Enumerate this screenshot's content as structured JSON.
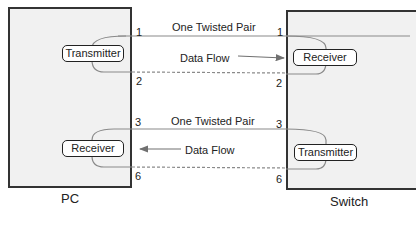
{
  "devices": {
    "pc": {
      "label": "PC",
      "top_component": "Transmitter",
      "bottom_component": "Receiver"
    },
    "switch": {
      "label": "Switch",
      "top_component": "Receiver",
      "bottom_component": "Transmitter"
    }
  },
  "pairs": [
    {
      "label": "One Twisted Pair",
      "flow_label": "Data Flow",
      "direction": "pc-to-switch",
      "pins_left": [
        "1",
        "2"
      ],
      "pins_right": [
        "1",
        "2"
      ]
    },
    {
      "label": "One Twisted Pair",
      "flow_label": "Data Flow",
      "direction": "switch-to-pc",
      "pins_left": [
        "3",
        "6"
      ],
      "pins_right": [
        "3",
        "6"
      ]
    }
  ],
  "colors": {
    "box_fill": "#f1f1f1",
    "box_border": "#333333",
    "wire": "#8a8a8a",
    "arrow": "#707070"
  }
}
